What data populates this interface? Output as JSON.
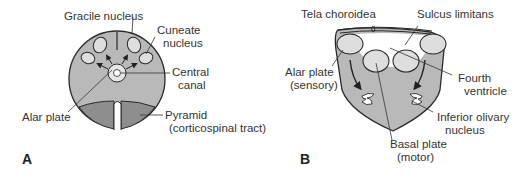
{
  "colors": {
    "tissue": "#b9b9b9",
    "pyramid": "#8e8e8e",
    "nucleus": "#dedede",
    "outline": "#2a2a2a",
    "text": "#333333"
  },
  "panel_a": {
    "letter": "A",
    "labels": {
      "gracile": "Gracile nucleus",
      "cuneate_1": "Cuneate",
      "cuneate_2": "nucleus",
      "central_1": "Central",
      "central_2": "canal",
      "alar": "Alar plate",
      "pyramid_1": "Pyramid",
      "pyramid_2": "(corticospinal tract)"
    }
  },
  "panel_b": {
    "letter": "B",
    "labels": {
      "tela": "Tela choroidea",
      "sulcus": "Sulcus limitans",
      "alar_1": "Alar plate",
      "alar_2": "(sensory)",
      "fourth_1": "Fourth",
      "fourth_2": "ventricle",
      "olivary_1": "Inferior olivary",
      "olivary_2": "nucleus",
      "basal_1": "Basal plate",
      "basal_2": "(motor)"
    }
  }
}
